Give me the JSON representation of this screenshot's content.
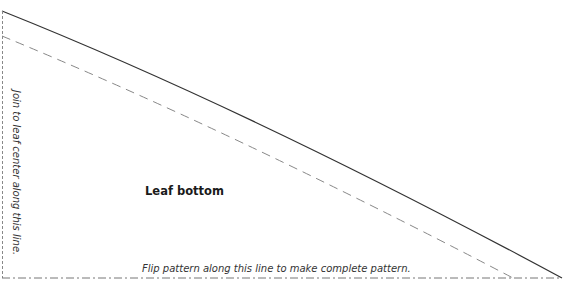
{
  "pattern": {
    "title": "Leaf bottom",
    "fold_instruction": "Join to leaf center along this line.",
    "flip_instruction": "Flip pattern along this line to make complete pattern."
  },
  "colors": {
    "cut_line": "#333333",
    "seam_line": "#888888",
    "fold_line": "#777777"
  }
}
